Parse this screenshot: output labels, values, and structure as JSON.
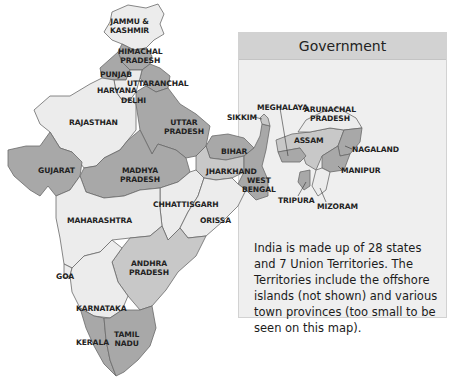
{
  "panel": {
    "title": "Government",
    "description": "India is made up of 28 states and 7 Union Territories. The Territories include the offshore islands (not shown) and various town provinces (too small to be seen on this map)."
  },
  "states": {
    "jammu_kashmir": [
      "JAMMU &",
      "KASHMIR"
    ],
    "himachal_pradesh": [
      "HIMACHAL",
      "PRADESH"
    ],
    "punjab": "PUNJAB",
    "uttaranchal": "UTTARANCHAL",
    "haryana": "HARYANA",
    "delhi": "DELHI",
    "rajasthan": "RAJASTHAN",
    "uttar_pradesh": [
      "UTTAR",
      "PRADESH"
    ],
    "gujarat": "GUJARAT",
    "madhya_pradesh": [
      "MADHYA",
      "PRADESH"
    ],
    "bihar": "BIHAR",
    "jharkhand": "JHARKHAND",
    "west_bengal": [
      "WEST",
      "BENGAL"
    ],
    "sikkim": "SIKKIM",
    "meghalaya": "MEGHALAYA",
    "arunachal_pradesh": [
      "ARUNACHAL",
      "PRADESH"
    ],
    "assam": "ASSAM",
    "nagaland": "NAGALAND",
    "manipur": "MANIPUR",
    "tripura": "TRIPURA",
    "mizoram": "MIZORAM",
    "chhattisgarh": "CHHATTISGARH",
    "orissa": "ORISSA",
    "maharashtra": "MAHARASHTRA",
    "goa": "GOA",
    "andhra_pradesh": [
      "ANDHRA",
      "PRADESH"
    ],
    "karnataka": "KARNATAKA",
    "kerala": "KERALA",
    "tamil_nadu": [
      "TAMIL",
      "NADU"
    ]
  },
  "colors": {
    "light_fill": "#ececec",
    "mid_fill": "#c8c8c8",
    "dark_fill": "#a8a8a8",
    "border": "#6a6a6a",
    "panel_bg": "#efefef",
    "panel_header": "#d2d2d2"
  }
}
